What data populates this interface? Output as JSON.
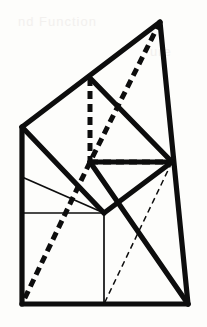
{
  "figure": {
    "canvas": {
      "width": 207,
      "height": 327
    },
    "background_color": "#fdfdfb",
    "ink_color": "#0d0d0d",
    "stroke_widths": {
      "thick": 5.2,
      "thick_dashed": 5.0,
      "thin": 1.7,
      "thin_dashed": 1.5
    },
    "dash_patterns": {
      "thick_dashed": "8 5",
      "thin_dashed": "6 4"
    },
    "points": {
      "apex": {
        "x": 160,
        "y": 22,
        "label": "apex"
      },
      "top_mid": {
        "x": 90,
        "y": 78,
        "label": "top-mid"
      },
      "left_upper": {
        "x": 22,
        "y": 127,
        "label": "left-upper"
      },
      "center": {
        "x": 90,
        "y": 162,
        "label": "center-hub"
      },
      "right_mid": {
        "x": 172,
        "y": 162,
        "label": "right-mid-hub"
      },
      "left_mid": {
        "x": 22,
        "y": 213,
        "label": "left-mid"
      },
      "mid_bottom": {
        "x": 104,
        "y": 213,
        "label": "mid-bottom"
      },
      "bottom_left": {
        "x": 22,
        "y": 304,
        "label": "bottom-left"
      },
      "bottom_mid": {
        "x": 104,
        "y": 304,
        "label": "bottom-mid"
      },
      "bottom_right": {
        "x": 188,
        "y": 304,
        "label": "bottom-right"
      },
      "left_thin": {
        "x": 22,
        "y": 177,
        "label": "left-thin-anchor"
      }
    },
    "segments": [
      {
        "name": "outline-apex-to-left-upper",
        "kind": "thick-solid",
        "from": [
          160,
          22
        ],
        "to": [
          22,
          127
        ]
      },
      {
        "name": "outline-apex-to-bottom-right",
        "kind": "thick-solid",
        "from": [
          160,
          22
        ],
        "to": [
          188,
          304
        ]
      },
      {
        "name": "outline-left-edge",
        "kind": "thick-solid",
        "from": [
          22,
          127
        ],
        "to": [
          22,
          304
        ]
      },
      {
        "name": "outline-bottom-edge",
        "kind": "thick-solid",
        "from": [
          22,
          304
        ],
        "to": [
          188,
          304
        ]
      },
      {
        "name": "chord-topmid-to-rightmid",
        "kind": "thick-solid",
        "from": [
          90,
          78
        ],
        "to": [
          172,
          162
        ]
      },
      {
        "name": "chord-leftupper-to-midbottom",
        "kind": "thick-solid",
        "from": [
          22,
          127
        ],
        "to": [
          104,
          213
        ]
      },
      {
        "name": "chord-center-to-rightmid-lower",
        "kind": "thick-solid",
        "from": [
          90,
          162
        ],
        "to": [
          172,
          162
        ]
      },
      {
        "name": "chord-rightmid-to-midbottom",
        "kind": "thick-solid",
        "from": [
          172,
          162
        ],
        "to": [
          104,
          213
        ]
      },
      {
        "name": "chord-center-to-bottomright",
        "kind": "thick-solid",
        "from": [
          90,
          162
        ],
        "to": [
          188,
          304
        ]
      },
      {
        "name": "dashed-apex-to-center",
        "kind": "thick-dashed",
        "from": [
          160,
          22
        ],
        "to": [
          90,
          162
        ]
      },
      {
        "name": "dashed-center-to-bottomleft",
        "kind": "thick-dashed",
        "from": [
          90,
          162
        ],
        "to": [
          22,
          304
        ]
      },
      {
        "name": "dashed-topmid-vertical",
        "kind": "thick-dashed",
        "from": [
          90,
          78
        ],
        "to": [
          90,
          162
        ]
      },
      {
        "name": "dashed-center-horizontal",
        "kind": "thick-dashed",
        "from": [
          90,
          162
        ],
        "to": [
          172,
          162
        ]
      },
      {
        "name": "thin-left-to-center",
        "kind": "thin-solid",
        "from": [
          22,
          177
        ],
        "to": [
          104,
          213
        ]
      },
      {
        "name": "thin-horizontal-midband",
        "kind": "thin-solid",
        "from": [
          22,
          213
        ],
        "to": [
          104,
          213
        ]
      },
      {
        "name": "thin-vertical-bottom",
        "kind": "thin-solid",
        "from": [
          104,
          213
        ],
        "to": [
          104,
          304
        ]
      },
      {
        "name": "thin-dashed-rightmid-to-bottommid",
        "kind": "thin-dashed",
        "from": [
          172,
          162
        ],
        "to": [
          104,
          304
        ]
      }
    ]
  },
  "artifacts": {
    "ghost_top": "nd Function",
    "ghost_mid": "ure"
  }
}
